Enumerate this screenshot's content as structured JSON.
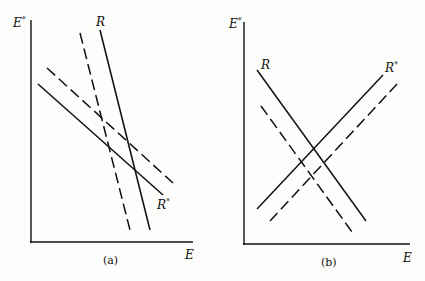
{
  "panels": [
    {
      "caption": "(a)",
      "y_axis_label": "E*",
      "x_axis_label": "E",
      "curve_labels": {
        "R": "R",
        "R_star": "R*"
      },
      "description": "R steep downward, R* shallow downward; dashed curves are shifted versions"
    },
    {
      "caption": "(b)",
      "y_axis_label": "E*",
      "x_axis_label": "E",
      "curve_labels": {
        "R": "R",
        "R_star": "R*"
      },
      "description": "R downward sloping, R* upward sloping; dashed curves are shifted versions"
    }
  ],
  "labels": {
    "a_ylabel_main": "E",
    "a_ylabel_sup": "*",
    "a_xlabel": "E",
    "a_R": "R",
    "a_Rstar_main": "R",
    "a_Rstar_sup": "*",
    "a_caption": "(a)",
    "b_ylabel_main": "E",
    "b_ylabel_sup": "*",
    "b_xlabel": "E",
    "b_R": "R",
    "b_Rstar_main": "R",
    "b_Rstar_sup": "*",
    "b_caption": "(b)"
  },
  "colors": {
    "ink": "#111111",
    "background": "#fdfdfb"
  }
}
